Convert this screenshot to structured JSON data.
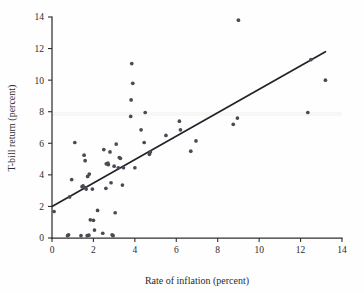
{
  "figure": {
    "background_color": "#fefefe",
    "point_color": "#4a4a52",
    "line_color": "#222228",
    "axis_color": "#2f2f2f"
  },
  "chart_data": {
    "type": "scatter",
    "title": "",
    "xlabel": "Rate of inflation (percent)",
    "ylabel": "T-bill return (percent)",
    "xlim": [
      0,
      14
    ],
    "ylim": [
      0,
      14
    ],
    "xticks": [
      0,
      2,
      4,
      6,
      8,
      10,
      12,
      14
    ],
    "yticks": [
      0,
      2,
      4,
      6,
      8,
      10,
      12,
      14
    ],
    "xticklabels": [
      "0",
      "2",
      "4",
      "6",
      "8",
      "10",
      "12",
      "14"
    ],
    "yticklabels": [
      "0",
      "2",
      "4",
      "6",
      "8",
      "10",
      "12",
      "14"
    ],
    "grid": false,
    "legend": null,
    "series": [
      {
        "name": "Annual observations",
        "marker": "circle",
        "color": "#4a4a52",
        "points": [
          [
            0.1,
            1.68
          ],
          [
            0.75,
            0.15
          ],
          [
            0.8,
            0.2
          ],
          [
            0.85,
            2.6
          ],
          [
            0.95,
            3.7
          ],
          [
            1.1,
            6.05
          ],
          [
            1.4,
            0.15
          ],
          [
            1.45,
            3.25
          ],
          [
            1.5,
            3.3
          ],
          [
            1.55,
            5.25
          ],
          [
            1.6,
            3.2
          ],
          [
            1.6,
            4.9
          ],
          [
            1.65,
            3.1
          ],
          [
            1.7,
            0.15
          ],
          [
            1.72,
            3.9
          ],
          [
            1.78,
            0.18
          ],
          [
            1.8,
            4.05
          ],
          [
            1.85,
            1.15
          ],
          [
            1.95,
            3.1
          ],
          [
            2.0,
            1.12
          ],
          [
            2.05,
            0.5
          ],
          [
            2.2,
            1.75
          ],
          [
            2.45,
            0.3
          ],
          [
            2.5,
            5.6
          ],
          [
            2.6,
            3.15
          ],
          [
            2.62,
            4.7
          ],
          [
            2.7,
            4.75
          ],
          [
            2.72,
            4.65
          ],
          [
            2.8,
            5.45
          ],
          [
            2.85,
            3.5
          ],
          [
            2.9,
            0.2
          ],
          [
            2.95,
            0.15
          ],
          [
            3.0,
            4.55
          ],
          [
            3.05,
            1.6
          ],
          [
            3.1,
            5.95
          ],
          [
            3.2,
            4.45
          ],
          [
            3.25,
            5.1
          ],
          [
            3.3,
            5.05
          ],
          [
            3.4,
            3.35
          ],
          [
            3.45,
            4.45
          ],
          [
            3.8,
            7.7
          ],
          [
            3.82,
            8.75
          ],
          [
            3.85,
            11.05
          ],
          [
            3.9,
            9.8
          ],
          [
            4.0,
            4.45
          ],
          [
            4.3,
            6.85
          ],
          [
            4.45,
            6.05
          ],
          [
            4.5,
            7.95
          ],
          [
            4.7,
            5.3
          ],
          [
            4.75,
            5.45
          ],
          [
            5.5,
            6.5
          ],
          [
            6.15,
            7.4
          ],
          [
            6.2,
            6.85
          ],
          [
            6.7,
            5.5
          ],
          [
            6.95,
            6.15
          ],
          [
            8.75,
            7.2
          ],
          [
            8.95,
            7.6
          ],
          [
            9.0,
            13.8
          ],
          [
            12.35,
            7.95
          ],
          [
            12.5,
            11.3
          ],
          [
            13.2,
            10.0
          ]
        ]
      }
    ],
    "fit_line": {
      "name": "Least-squares regression line",
      "x": [
        0.0,
        13.2
      ],
      "y": [
        2.0,
        11.8
      ],
      "color": "#222228"
    }
  }
}
